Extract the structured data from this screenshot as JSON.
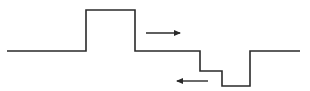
{
  "diagram": {
    "colors": {
      "line": "#2a2a2a",
      "background": "#ffffff"
    },
    "waveform_points": "7,51 86,51 86,10 135,10 135,51 200,51 200,71 222,71 222,86 250,86 250,51 300,51",
    "arrows": [
      {
        "name": "right-arrow",
        "direction": "right",
        "x1": 146,
        "y1": 33,
        "x2": 180,
        "y2": 33
      },
      {
        "name": "left-arrow",
        "direction": "left",
        "x1": 208,
        "y1": 81,
        "x2": 177,
        "y2": 81
      }
    ]
  }
}
